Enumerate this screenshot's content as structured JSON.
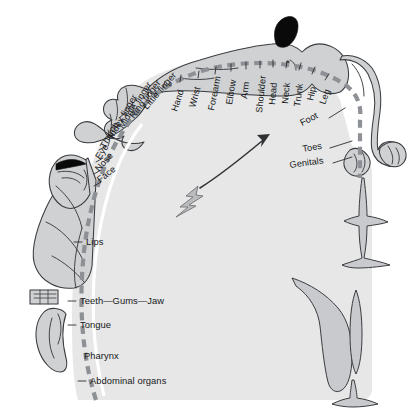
{
  "figure": {
    "name": "sensory-cortical-homunculus",
    "title": "Sensory homunculus along the postcentral gyrus",
    "background_color": "#ffffff",
    "cortex_color": "#e7e7e7",
    "body_fill_color": "#cfd1d3",
    "outline_color": "#3a3c3f",
    "arc_color": "#8d9094",
    "label_color": "#16181a",
    "hair_color": "#0a0a0a",
    "bolt_color": "#b9bbbd"
  },
  "arc_labels": [
    {
      "id": "face",
      "text": "Face",
      "x": 100,
      "y": 183,
      "rotate": -38,
      "tick": true,
      "anchor": "start"
    },
    {
      "id": "nose",
      "text": "Nose",
      "x": 96,
      "y": 170,
      "rotate": -48,
      "tick": true,
      "anchor": "start"
    },
    {
      "id": "eye",
      "text": "Eye",
      "x": 96,
      "y": 158,
      "rotate": -56,
      "tick": true,
      "anchor": "start"
    },
    {
      "id": "thumb",
      "text": "Thumb",
      "x": 101,
      "y": 148,
      "rotate": -60,
      "tick": true,
      "anchor": "start"
    },
    {
      "id": "index-finger",
      "text": "Index finger",
      "x": 110,
      "y": 139,
      "rotate": -60,
      "tick": true,
      "anchor": "start"
    },
    {
      "id": "middle-finger",
      "text": "Middle finger",
      "x": 121,
      "y": 128,
      "rotate": -57,
      "tick": true,
      "anchor": "start"
    },
    {
      "id": "ring-finger",
      "text": "Ring finger",
      "x": 133,
      "y": 119,
      "rotate": -53,
      "tick": true,
      "anchor": "start"
    },
    {
      "id": "little-finger",
      "text": "Little finger",
      "x": 147,
      "y": 110,
      "rotate": -49,
      "tick": true,
      "anchor": "start"
    },
    {
      "id": "hand",
      "text": "Hand",
      "x": 178,
      "y": 110,
      "rotate": -72,
      "tick": true,
      "anchor": "start"
    },
    {
      "id": "wrist",
      "text": "Wrist",
      "x": 196,
      "y": 107,
      "rotate": -75,
      "tick": true,
      "anchor": "start"
    },
    {
      "id": "forearm",
      "text": "Forearm",
      "x": 216,
      "y": 110,
      "rotate": -79,
      "tick": true,
      "anchor": "start"
    },
    {
      "id": "elbow",
      "text": "Elbow",
      "x": 234,
      "y": 105,
      "rotate": -81,
      "tick": true,
      "anchor": "start"
    },
    {
      "id": "arm",
      "text": "Arm",
      "x": 249,
      "y": 100,
      "rotate": -83,
      "tick": true,
      "anchor": "start"
    },
    {
      "id": "shoulder",
      "text": "Shoulder",
      "x": 264,
      "y": 110,
      "rotate": -84,
      "tick": true,
      "anchor": "start"
    },
    {
      "id": "head",
      "text": "Head",
      "x": 276,
      "y": 104,
      "rotate": -85,
      "tick": true,
      "anchor": "start"
    },
    {
      "id": "neck",
      "text": "Neck",
      "x": 288,
      "y": 103,
      "rotate": -85,
      "tick": true,
      "anchor": "start"
    },
    {
      "id": "trunk",
      "text": "Trunk",
      "x": 300,
      "y": 106,
      "rotate": -83,
      "tick": true,
      "anchor": "start"
    },
    {
      "id": "hip",
      "text": "Hip",
      "x": 313,
      "y": 100,
      "rotate": -78,
      "tick": true,
      "anchor": "start"
    },
    {
      "id": "leg",
      "text": "Leg",
      "x": 325,
      "y": 104,
      "rotate": -70,
      "tick": true,
      "anchor": "start"
    },
    {
      "id": "foot",
      "text": "Foot",
      "x": 305,
      "y": 124,
      "rotate": -27,
      "tick": false,
      "anchor": "start"
    },
    {
      "id": "toes",
      "text": "Toes",
      "x": 306,
      "y": 152,
      "rotate": -10,
      "tick": false,
      "anchor": "start"
    },
    {
      "id": "genitals",
      "text": "Genitals",
      "x": 298,
      "y": 167,
      "rotate": -8,
      "tick": false,
      "anchor": "start"
    }
  ],
  "straight_labels": [
    {
      "id": "lips",
      "text": "Lips",
      "x": 86,
      "y": 242,
      "tick": true
    },
    {
      "id": "teeth-gums-jaw",
      "text": "Teeth—Gums—Jaw",
      "x": 80,
      "y": 301,
      "tick": true
    },
    {
      "id": "tongue",
      "text": "Tongue",
      "x": 80,
      "y": 325,
      "tick": true
    },
    {
      "id": "pharynx",
      "text": "Pharynx",
      "x": 84,
      "y": 356,
      "tick": false
    },
    {
      "id": "abdominal-organs",
      "text": "Abdominal organs",
      "x": 90,
      "y": 381,
      "tick": true
    }
  ],
  "leader_lines": [
    {
      "id": "leader-foot",
      "x1": 329,
      "y1": 118,
      "x2": 345,
      "y2": 108
    },
    {
      "id": "leader-toes",
      "x1": 330,
      "y1": 148,
      "x2": 352,
      "y2": 141
    },
    {
      "id": "leader-genitals",
      "x1": 333,
      "y1": 163,
      "x2": 352,
      "y2": 157
    }
  ],
  "annotations": {
    "lightning_bolt": "lightning-bolt-icon",
    "arrow": "curved-arrow-icon",
    "arrow_from": "hand-region",
    "arrow_to": "shoulder-region"
  }
}
